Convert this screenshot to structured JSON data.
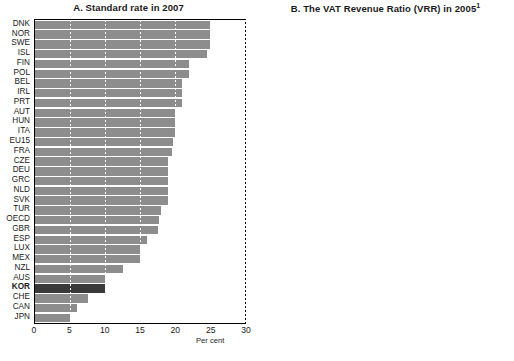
{
  "figure": {
    "unit_label_a": "Per cent",
    "unit_label_b": "Per cent"
  },
  "chart_data": [
    {
      "type": "bar",
      "orientation": "horizontal",
      "panel": "A",
      "title": "A. Standard rate in 2007",
      "xlabel": "Per cent",
      "ylabel": "",
      "xlim": [
        0,
        30
      ],
      "xticks": [
        0,
        5,
        10,
        15,
        20,
        25,
        30
      ],
      "grid": true,
      "grid_axis": "x",
      "highlight": "KOR",
      "bar_color": "#8d8d8d",
      "highlight_color": "#3a3a3a",
      "categories": [
        "DNK",
        "NOR",
        "SWE",
        "ISL",
        "FIN",
        "POL",
        "BEL",
        "IRL",
        "PRT",
        "AUT",
        "HUN",
        "ITA",
        "EU15",
        "FRA",
        "CZE",
        "DEU",
        "GRC",
        "NLD",
        "SVK",
        "TUR",
        "OECD",
        "GBR",
        "ESP",
        "LUX",
        "MEX",
        "NZL",
        "AUS",
        "KOR",
        "CHE",
        "CAN",
        "JPN"
      ],
      "values": [
        25.0,
        25.0,
        25.0,
        24.5,
        22.0,
        22.0,
        21.0,
        21.0,
        21.0,
        20.0,
        20.0,
        20.0,
        19.7,
        19.6,
        19.0,
        19.0,
        19.0,
        19.0,
        19.0,
        18.0,
        17.7,
        17.5,
        16.0,
        15.0,
        15.0,
        12.5,
        10.0,
        10.0,
        7.6,
        6.0,
        5.0
      ]
    },
    {
      "type": "bar",
      "orientation": "horizontal",
      "panel": "B",
      "title": "B. The VAT Revenue Ratio (VRR) in 2005",
      "title_superscript": "1",
      "xlabel": "Per cent",
      "ylabel": "",
      "xlim": [
        0,
        106
      ],
      "xticks": [
        0,
        10,
        20,
        30,
        40,
        50,
        60,
        70,
        80,
        90,
        100
      ],
      "grid": true,
      "grid_axis": "x",
      "highlight": "KOR",
      "bar_color": "#8d8d8d",
      "highlight_color": "#3a3a3a",
      "categories": [
        "NZL",
        "LUX",
        "CHE",
        "JPN",
        "KOR",
        "IRL",
        "ISL",
        "DNK",
        "NLD",
        "FIN",
        "AUT",
        "CZE",
        "OECD",
        "NOR",
        "AUS",
        "EU15",
        "ESP",
        "SWE",
        "DEU",
        "TUR",
        "SVK",
        "CAN",
        "FRA",
        "BEL",
        "HUN",
        "GBR",
        "POL",
        "PRT",
        "GRC",
        "ITA",
        "MEX"
      ],
      "values": [
        106.0,
        70.0,
        68.0,
        67.0,
        66.0,
        63.0,
        62.0,
        61.0,
        60.0,
        59.5,
        59.0,
        58.5,
        58.0,
        57.5,
        57.0,
        56.0,
        55.5,
        55.0,
        54.5,
        54.0,
        53.5,
        52.0,
        51.5,
        51.0,
        50.5,
        50.0,
        48.0,
        47.0,
        45.0,
        38.5,
        34.5
      ]
    }
  ]
}
